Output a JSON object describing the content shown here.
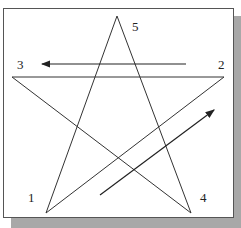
{
  "diagram": {
    "type": "star-drawing-sequence",
    "labels": [
      {
        "id": "1",
        "text": "1",
        "x": 18,
        "y": 203
      },
      {
        "id": "2",
        "text": "2",
        "x": 217,
        "y": 69
      },
      {
        "id": "3",
        "text": "3",
        "x": 17,
        "y": 69
      },
      {
        "id": "4",
        "text": "4",
        "x": 200,
        "y": 203
      },
      {
        "id": "5",
        "text": "5",
        "x": 132,
        "y": 31
      }
    ],
    "colors": {
      "line": "#333333",
      "shadow": "#a8a8a8",
      "border": "#555555"
    }
  }
}
